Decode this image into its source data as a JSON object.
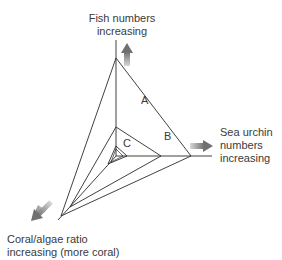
{
  "diagram": {
    "type": "radar-triangle",
    "axes": [
      {
        "id": "fish",
        "label_line1": "Fish numbers",
        "label_line2": "increasing",
        "direction": "up"
      },
      {
        "id": "urchin",
        "label_line1": "Sea urchin",
        "label_line2": "numbers",
        "label_line3": "increasing",
        "direction": "right"
      },
      {
        "id": "coral",
        "label_line1": "Coral/algae ratio",
        "label_line2": "increasing (more coral)",
        "direction": "down-left"
      }
    ],
    "triangles": [
      {
        "label": "A",
        "fish": 98,
        "urchin": 74,
        "coral": 84
      },
      {
        "label": "B",
        "fish": 29,
        "urchin": 45,
        "coral": 72
      },
      {
        "label": "C",
        "fish": 10,
        "urchin": 10,
        "coral": 11
      }
    ],
    "colors": {
      "line": "#2b2b2b",
      "arrow": "#7a7a7a",
      "text": "#3a3a3a"
    }
  }
}
